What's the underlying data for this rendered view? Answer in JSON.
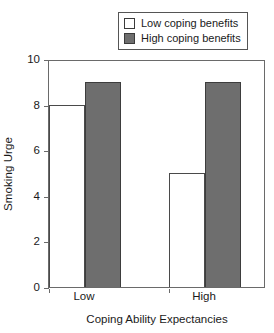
{
  "chart_data": {
    "type": "bar",
    "title": "",
    "subtitle": "",
    "xlabel": "Coping Ability Expectancies",
    "ylabel": "Smoking Urge",
    "categories": [
      "Low",
      "High"
    ],
    "series": [
      {
        "name": "Low coping benefits",
        "values": [
          8,
          5
        ],
        "color": "#ffffff",
        "edge_color": "#4a4a4a"
      },
      {
        "name": "High coping benefits",
        "values": [
          9,
          9
        ],
        "color": "#6e6e6e",
        "edge_color": "#3d3d3d"
      }
    ],
    "ylim": [
      0,
      10
    ],
    "yticks": [
      0,
      2,
      4,
      6,
      8,
      10
    ],
    "ytick_labels": [
      "0",
      "2",
      "4",
      "6",
      "8",
      "10"
    ],
    "grid": false,
    "legend_position": "top-right",
    "frame": "full-box"
  },
  "legend": {
    "items": [
      {
        "label": "Low coping benefits",
        "swatch": "legend-swatch-light"
      },
      {
        "label": "High coping benefits",
        "swatch": "legend-swatch-dark"
      }
    ]
  },
  "axes": {
    "y_title": "Smoking Urge",
    "x_title": "Coping Ability Expectancies",
    "y_ticks": [
      "0",
      "2",
      "4",
      "6",
      "8",
      "10"
    ],
    "x_categories": [
      "Low",
      "High"
    ]
  }
}
